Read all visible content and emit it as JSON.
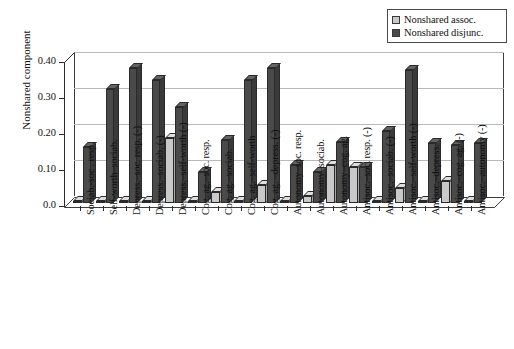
{
  "chart_data": {
    "type": "bar",
    "title": "",
    "subtitle": "",
    "xlabel": "",
    "ylabel": "Nonshared component",
    "ylim": [
      0.0,
      0.4
    ],
    "ytick_labels": [
      "0.0",
      "0.10",
      "0.20",
      "0.30",
      "0.40"
    ],
    "ytick_values": [
      0.0,
      0.1,
      0.2,
      0.3,
      0.4
    ],
    "grid": true,
    "legend_position": "top-right",
    "style": "3d-bar",
    "categories": [
      "Sociab.-soc . resp.",
      "Self-worth–sociab.",
      "Depress.–soc. resp. (-)",
      "Depress.–sociab. (-)",
      "Depress.–self-worth (-)",
      "Cog. ag.–soc. resp.",
      "Cog. ag.–sociab.",
      "Cog. ag.–self-worth",
      "Cog. ag. –depress. (-)",
      "Autonomy–soc. resp.",
      "Autonomy–sociab.",
      "Autonomy–cog. ag.",
      "Antisoc.–soc. resp. (-)",
      "Antisoc.–sociab. (-)",
      "Antisoc.–self-worth (-)",
      "Antisoc.–depress.",
      "Antisoc.–cog. ag. (-)",
      "Antisoc.–autonomy (-)"
    ],
    "series": [
      {
        "name": "Nonshared assoc.",
        "color": "#c9c9c9",
        "values": [
          0.005,
          0.005,
          0.005,
          0.005,
          0.18,
          0.005,
          0.03,
          0.005,
          0.05,
          0.005,
          0.02,
          0.105,
          0.1,
          0.005,
          0.04,
          0.005,
          0.06,
          0.005
        ]
      },
      {
        "name": "Nonshared disjunc.",
        "color": "#4a4a4a",
        "values": [
          0.155,
          0.315,
          0.375,
          0.34,
          0.265,
          0.085,
          0.175,
          0.34,
          0.375,
          0.105,
          0.085,
          0.17,
          0.1,
          0.2,
          0.37,
          0.165,
          0.16,
          0.165
        ]
      }
    ]
  },
  "legend": {
    "items": [
      {
        "label": "Nonshared assoc.",
        "color": "#c9c9c9"
      },
      {
        "label": "Nonshared disjunc.",
        "color": "#4a4a4a"
      }
    ]
  },
  "colors": {
    "assoc": "#c9c9c9",
    "assoc_side": "#a8a8a8",
    "assoc_top": "#dedede",
    "disjunc": "#4a4a4a",
    "disjunc_side": "#3a3a3a",
    "disjunc_top": "#636363",
    "axis": "#2b2b2b",
    "grid": "#b9b9b9",
    "background": "#ffffff"
  }
}
